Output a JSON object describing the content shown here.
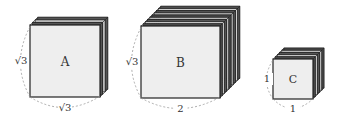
{
  "figures": [
    {
      "id": "A",
      "label": "A",
      "height_label": "√3",
      "width_label": "√3",
      "face": {
        "x": 30,
        "y": 25,
        "w": 70,
        "h": 72
      },
      "layers": 4,
      "step": 2.6
    },
    {
      "id": "B",
      "label": "B",
      "height_label": "√3",
      "width_label": "2",
      "face": {
        "x": 141,
        "y": 26,
        "w": 79,
        "h": 72
      },
      "layers": 10,
      "step": 2.2
    },
    {
      "id": "C",
      "label": "C",
      "height_label": "1",
      "width_label": "1",
      "face": {
        "x": 273,
        "y": 59,
        "w": 40,
        "h": 40
      },
      "layers": 6,
      "step": 2.2
    }
  ],
  "colors": {
    "face": "#eeeeee",
    "edge": "#222222",
    "layer_dark": "#555555",
    "layer_light": "#cfcfcf",
    "dashed": "#999999"
  }
}
